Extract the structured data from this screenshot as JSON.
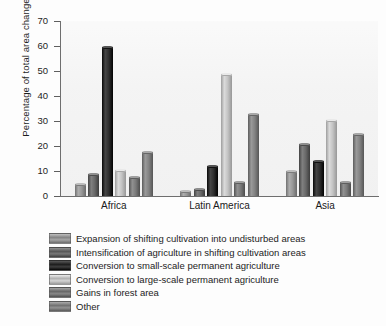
{
  "chart_data": {
    "type": "bar",
    "title": "",
    "subtitle": "",
    "xlabel": "",
    "ylabel": "Percentage of total area change",
    "categories": [
      "Africa",
      "Latin America",
      "Asia"
    ],
    "ylim": [
      0,
      70
    ],
    "yticks": [
      0,
      10,
      20,
      30,
      40,
      50,
      60,
      70
    ],
    "ytick_labels": [
      "0",
      "10",
      "20",
      "30",
      "40",
      "50",
      "60",
      "70"
    ],
    "grid": false,
    "legend_position": "below",
    "series": [
      {
        "name": "Expansion of shifting cultivation into undisturbed areas",
        "color": "#8c8c8c",
        "values": [
          4.8,
          2.0,
          10.0
        ]
      },
      {
        "name": "Intensification of agriculture in shifting cultivation areas",
        "color": "#5e5e5e",
        "values": [
          8.7,
          3.0,
          21.0
        ]
      },
      {
        "name": "Conversion to small-scale permanent agriculture",
        "color": "#242424",
        "values": [
          59.5,
          12.0,
          14.0
        ]
      },
      {
        "name": "Conversion to large-scale permanent agriculture",
        "color": "#b9b9b9",
        "values": [
          10.5,
          49.0,
          30.5
        ]
      },
      {
        "name": "Gains in forest area",
        "color": "#6f6f6f",
        "values": [
          7.5,
          5.5,
          5.5
        ]
      },
      {
        "name": "Other",
        "color": "#787878",
        "values": [
          17.8,
          33.0,
          25.0
        ]
      }
    ]
  },
  "legend": {
    "items": [
      "Expansion of shifting cultivation into undisturbed areas",
      "Intensification of agriculture in shifting cultivation areas",
      "Conversion to small-scale permanent agriculture",
      "Conversion to large-scale permanent agriculture",
      "Gains in forest area",
      "Other"
    ]
  }
}
